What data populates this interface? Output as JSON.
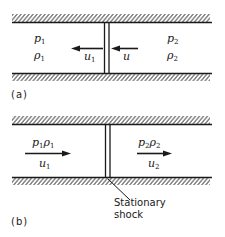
{
  "panel_a": {
    "caption": "(a)",
    "left_state": {
      "pressure": "p",
      "pressure_sub": "1",
      "density": "ρ",
      "density_sub": "1"
    },
    "right_state": {
      "pressure": "p",
      "pressure_sub": "2",
      "density": "ρ",
      "density_sub": "2"
    },
    "arrow_left": {
      "label": "u",
      "label_sub": "1",
      "direction": "left"
    },
    "arrow_right": {
      "label": "u",
      "label_sub": "",
      "direction": "left"
    }
  },
  "panel_b": {
    "caption": "(b)",
    "left_state": {
      "pressure": "p",
      "pressure_sub": "1",
      "density": "ρ",
      "density_sub": "1",
      "velocity": "u",
      "velocity_sub": "1",
      "direction": "right"
    },
    "right_state": {
      "pressure": "p",
      "pressure_sub": "2",
      "density": "ρ",
      "density_sub": "2",
      "velocity": "u",
      "velocity_sub": "2",
      "direction": "right"
    },
    "annotation_line1": "Stationary",
    "annotation_line2": "shock"
  },
  "colors": {
    "ink": "#1a1a1a",
    "background": "#ffffff"
  }
}
